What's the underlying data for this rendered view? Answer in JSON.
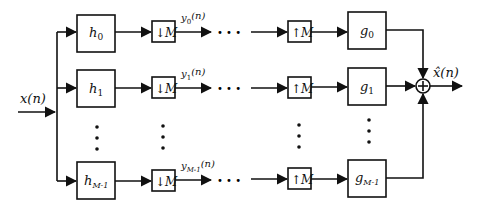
{
  "diagram": {
    "input_label": "x(n)",
    "output_label": "x̂(n)",
    "analysis_filters": [
      "h0",
      "h1",
      "hM-1"
    ],
    "analysis_filter_labels": [
      {
        "base": "h",
        "sub": "0"
      },
      {
        "base": "h",
        "sub": "1"
      },
      {
        "base": "h",
        "sub": "M-1"
      }
    ],
    "downsamplers": [
      "↓M",
      "↓M",
      "↓M"
    ],
    "downsampler_label": {
      "arrow": "↓",
      "factor": "M"
    },
    "upsampler_label": {
      "arrow": "↑",
      "factor": "M"
    },
    "subband_signals": [
      {
        "base": "y",
        "sub": "0",
        "arg": "(n)"
      },
      {
        "base": "y",
        "sub": "1",
        "arg": "(n)"
      },
      {
        "base": "y",
        "sub": "M-1",
        "arg": "(n)"
      }
    ],
    "synthesis_filter_labels": [
      {
        "base": "g",
        "sub": "0"
      },
      {
        "base": "g",
        "sub": "1"
      },
      {
        "base": "g",
        "sub": "M-1"
      }
    ],
    "ellipsis": "• • •",
    "summer_symbol": "+",
    "colors": {
      "stroke": "#111111",
      "background": "#ffffff"
    }
  }
}
